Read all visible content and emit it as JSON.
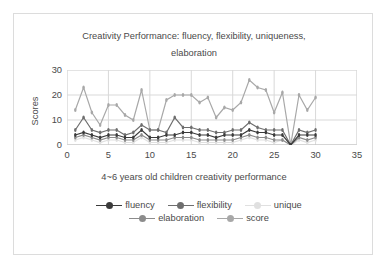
{
  "chart_data": {
    "type": "line",
    "title": "Creativity Performance: fluency, flexibility, uniqueness, elaboration",
    "title_line1": "Creativity Performance: fluency, flexibility, uniqueness,",
    "title_line2": "elaboration",
    "xlabel": "4~6 years old children creativity performance",
    "ylabel": "Scores",
    "xlim": [
      0,
      35
    ],
    "ylim": [
      0,
      30
    ],
    "xticks": [
      "0",
      "5",
      "10",
      "15",
      "20",
      "25",
      "30",
      "35"
    ],
    "yticks": [
      "0",
      "10",
      "20",
      "30"
    ],
    "grid": true,
    "legend_position": "bottom",
    "x": [
      1,
      2,
      3,
      4,
      5,
      6,
      7,
      8,
      9,
      10,
      11,
      12,
      13,
      14,
      15,
      16,
      17,
      18,
      19,
      20,
      21,
      22,
      23,
      24,
      25,
      26,
      27,
      28,
      29,
      30
    ],
    "series": [
      {
        "name": "fluency",
        "color": "#3b3b3b",
        "values": [
          4,
          5,
          4,
          3,
          4,
          4,
          3,
          3,
          6,
          3,
          3,
          4,
          4,
          5,
          5,
          4,
          4,
          3,
          4,
          4,
          4,
          6,
          5,
          5,
          4,
          4,
          0,
          4,
          4,
          4
        ]
      },
      {
        "name": "flexibility",
        "color": "#6e6e6e",
        "values": [
          6,
          11,
          6,
          5,
          6,
          6,
          4,
          5,
          8,
          6,
          6,
          5,
          11,
          7,
          7,
          6,
          6,
          5,
          5,
          6,
          6,
          9,
          7,
          6,
          6,
          6,
          0,
          6,
          5,
          6
        ]
      },
      {
        "name": "unique",
        "color": "#e0e0e0",
        "values": [
          2,
          3,
          2,
          1,
          2,
          2,
          1,
          1,
          3,
          1,
          1,
          1,
          2,
          2,
          2,
          1,
          1,
          1,
          1,
          1,
          2,
          3,
          2,
          2,
          1,
          2,
          0,
          2,
          1,
          2
        ]
      },
      {
        "name": "elaboration",
        "color": "#8c8c8c",
        "values": [
          3,
          4,
          3,
          2,
          3,
          3,
          2,
          2,
          4,
          2,
          2,
          2,
          3,
          3,
          3,
          2,
          2,
          2,
          2,
          2,
          3,
          4,
          3,
          3,
          2,
          2,
          0,
          3,
          2,
          3
        ]
      },
      {
        "name": "score",
        "color": "#a8a8a8",
        "values": [
          14,
          23,
          13,
          8,
          16,
          16,
          12,
          10,
          22,
          6,
          6,
          18,
          20,
          20,
          20,
          17,
          19,
          11,
          15,
          14,
          17,
          26,
          23,
          22,
          13,
          21,
          0,
          20,
          14,
          19
        ]
      }
    ]
  }
}
